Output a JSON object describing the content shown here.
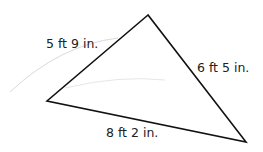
{
  "diagram": {
    "shape": "triangle",
    "vertices": {
      "top": [
        148,
        15
      ],
      "left": [
        47,
        101
      ],
      "right": [
        246,
        142
      ]
    },
    "sides": [
      {
        "id": "left-side",
        "label": "5 ft 9 in."
      },
      {
        "id": "right-side",
        "label": "6 ft 5 in."
      },
      {
        "id": "bottom-side",
        "label": "8 ft 2 in."
      }
    ],
    "stroke_color": "#111111",
    "label_color": "#222222",
    "faint_stroke_color": "#d8d8d8"
  }
}
